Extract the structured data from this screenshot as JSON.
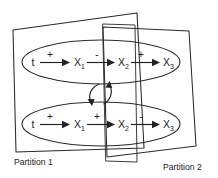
{
  "figure": {
    "background_color": "#ffffff",
    "line_color": "#2a2a2a",
    "text_color": "#1c1c1c"
  },
  "captions": {
    "left": "Partition 1",
    "right": "Partition 2"
  },
  "chains": {
    "top": {
      "name": "top-chain",
      "nodes": [
        {
          "label": "t",
          "sub": ""
        },
        {
          "label": "X",
          "sub": "1"
        },
        {
          "label": "X",
          "sub": "2"
        },
        {
          "label": "X",
          "sub": "3"
        }
      ],
      "edge_signs": [
        "+",
        "-",
        "+"
      ]
    },
    "bottom": {
      "name": "bottom-chain",
      "nodes": [
        {
          "label": "t",
          "sub": ""
        },
        {
          "label": "X",
          "sub": "1"
        },
        {
          "label": "X",
          "sub": "2"
        },
        {
          "label": "X",
          "sub": "3"
        }
      ],
      "edge_signs": [
        "+",
        "+",
        "-"
      ]
    }
  },
  "cross_links": {
    "down_arrow_name": "cross-link-down-arrow",
    "up_arrow_name": "cross-link-up-arrow"
  }
}
